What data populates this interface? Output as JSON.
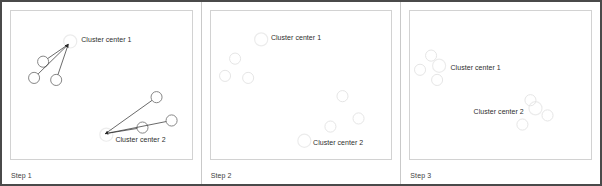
{
  "figure": {
    "border_color": "#4a4a4a",
    "background": "#ffffff"
  },
  "colors": {
    "point_stroke_strong": "#7a7a7a",
    "point_stroke_faint": "#e2e2e2",
    "point_stroke_mid": "#cfcfcf",
    "center_halo": "#ececec",
    "arrow": "#2b2b2b",
    "label_text": "#2e2e2e",
    "step_text": "#3d3d3d",
    "plot_border": "#d2d2d2",
    "panel_divider": "#c9c9c9"
  },
  "panels": [
    {
      "id": "step-1",
      "step_label": "Step 1",
      "centers": [
        {
          "name": "cluster-center-1",
          "label": "Cluster center 1",
          "cx": 59,
          "cy": 30,
          "r": 6.5,
          "label_x": 70,
          "label_y": 25
        },
        {
          "name": "cluster-center-2",
          "label": "Cluster center 2",
          "cx": 95,
          "cy": 122,
          "r": 6.5,
          "label_x": 104,
          "label_y": 123
        }
      ],
      "points": [
        {
          "cx": 32,
          "cy": 50,
          "r": 5.5,
          "tone": "strong"
        },
        {
          "cx": 23,
          "cy": 66,
          "r": 5.5,
          "tone": "strong"
        },
        {
          "cx": 45,
          "cy": 68,
          "r": 5.5,
          "tone": "strong"
        },
        {
          "cx": 145,
          "cy": 85,
          "r": 5.5,
          "tone": "strong"
        },
        {
          "cx": 160,
          "cy": 108,
          "r": 5.5,
          "tone": "strong"
        },
        {
          "cx": 131,
          "cy": 115,
          "r": 5.5,
          "tone": "strong"
        }
      ],
      "arrows": [
        {
          "from_x": 32,
          "from_y": 50,
          "to_x": 57,
          "to_y": 33
        },
        {
          "from_x": 23,
          "from_y": 66,
          "to_x": 57,
          "to_y": 33
        },
        {
          "from_x": 45,
          "from_y": 68,
          "to_x": 57,
          "to_y": 33
        },
        {
          "from_x": 145,
          "from_y": 85,
          "to_x": 94,
          "to_y": 121
        },
        {
          "from_x": 160,
          "from_y": 108,
          "to_x": 94,
          "to_y": 121
        },
        {
          "from_x": 131,
          "from_y": 115,
          "to_x": 94,
          "to_y": 121
        }
      ]
    },
    {
      "id": "step-2",
      "step_label": "Step 2",
      "centers": [
        {
          "name": "cluster-center-1",
          "label": "Cluster center 1",
          "cx": 50,
          "cy": 28,
          "r": 6.5,
          "label_x": 60,
          "label_y": 23
        },
        {
          "name": "cluster-center-2",
          "label": "Cluster center 2",
          "cx": 93,
          "cy": 128,
          "r": 6.5,
          "label_x": 102,
          "label_y": 126
        }
      ],
      "points": [
        {
          "cx": 24,
          "cy": 47,
          "r": 5.5,
          "tone": "faint"
        },
        {
          "cx": 14,
          "cy": 64,
          "r": 5.5,
          "tone": "faint"
        },
        {
          "cx": 37,
          "cy": 66,
          "r": 5.5,
          "tone": "faint"
        },
        {
          "cx": 131,
          "cy": 84,
          "r": 5.5,
          "tone": "faint"
        },
        {
          "cx": 147,
          "cy": 106,
          "r": 5.5,
          "tone": "faint"
        },
        {
          "cx": 119,
          "cy": 114,
          "r": 5.5,
          "tone": "faint"
        }
      ],
      "arrows": []
    },
    {
      "id": "step-3",
      "step_label": "Step 3",
      "centers": [
        {
          "name": "cluster-center-1",
          "label": "Cluster center 1",
          "cx": 29,
          "cy": 54,
          "r": 6.5,
          "label_x": 40,
          "label_y": 52
        },
        {
          "name": "cluster-center-2",
          "label": "Cluster center 2",
          "cx": 125,
          "cy": 96,
          "r": 6.5,
          "label_x": 63,
          "label_y": 96
        }
      ],
      "points": [
        {
          "cx": 21,
          "cy": 44,
          "r": 5.5,
          "tone": "faint"
        },
        {
          "cx": 10,
          "cy": 58,
          "r": 5.5,
          "tone": "faint"
        },
        {
          "cx": 27,
          "cy": 68,
          "r": 5.5,
          "tone": "faint"
        },
        {
          "cx": 120,
          "cy": 88,
          "r": 5.5,
          "tone": "faint"
        },
        {
          "cx": 137,
          "cy": 103,
          "r": 5.5,
          "tone": "faint"
        },
        {
          "cx": 112,
          "cy": 112,
          "r": 5.5,
          "tone": "faint"
        }
      ],
      "arrows": []
    }
  ]
}
